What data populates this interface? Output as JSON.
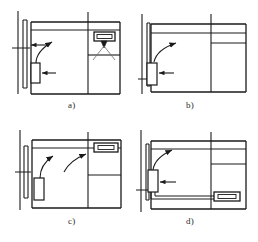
{
  "figure": {
    "title_fragment": "",
    "type": "architectural-floor-plan-set",
    "panel_count": 4,
    "line_color": "#1a1a1a",
    "accent_color": "#3a3a3a",
    "background": "#ffffff"
  },
  "labels": {
    "a": "a)",
    "b": "b)",
    "c": "c)",
    "d": "d)"
  },
  "panels": [
    {
      "id": "a",
      "label": "a)",
      "position": "top-left",
      "description": "Floor plan with double left wall, horizontal top corridor band, vertical partition at right, wall-mounted device on lower left wall and ceiling-mounted device at upper right with two leader lines",
      "devices": [
        {
          "name": "wall-mounted-box-left",
          "orientation": "vertical",
          "wall": "left"
        },
        {
          "name": "ceiling-mounted-box-right",
          "orientation": "horizontal",
          "wall": "top-right"
        }
      ],
      "arrows": [
        {
          "name": "curved-leader-left",
          "style": "curved"
        },
        {
          "name": "pointer-arrow-left",
          "style": "straight-horizontal"
        },
        {
          "name": "pointer-arrow-top",
          "style": "straight-horizontal"
        },
        {
          "name": "leader-pair-right",
          "style": "converging-v"
        }
      ]
    },
    {
      "id": "b",
      "label": "b)",
      "position": "top-right",
      "description": "Floor plan with double left wall and device mounted directly on left wall, horizontal top corridor band, vertical partition at right with short horizontal return",
      "devices": [
        {
          "name": "wall-mounted-box-left",
          "orientation": "vertical",
          "wall": "left"
        }
      ],
      "arrows": [
        {
          "name": "curved-leader-left",
          "style": "curved"
        },
        {
          "name": "pointer-arrow-left",
          "style": "straight-horizontal"
        }
      ]
    },
    {
      "id": "c",
      "label": "c)",
      "position": "bottom-left",
      "description": "Floor plan with double left wall, horizontal top corridor band, vertical partition at right, free-standing device at lower left and horizontal device recessed in the upper right corridor",
      "devices": [
        {
          "name": "floor-box-left",
          "orientation": "vertical",
          "wall": "none"
        },
        {
          "name": "corridor-box-right",
          "orientation": "horizontal",
          "wall": "top-right"
        }
      ],
      "arrows": [
        {
          "name": "curved-leader-left",
          "style": "curved"
        },
        {
          "name": "curved-leader-right",
          "style": "curved"
        }
      ]
    },
    {
      "id": "d",
      "label": "d)",
      "position": "bottom-right",
      "description": "Floor plan with double left wall, device on left wall connected by a routed conduit running down and along the bottom to a horizontal device at the lower right",
      "devices": [
        {
          "name": "wall-mounted-box-left",
          "orientation": "vertical",
          "wall": "left"
        },
        {
          "name": "conduit-box-bottom-right",
          "orientation": "horizontal",
          "wall": "bottom-right"
        }
      ],
      "arrows": [
        {
          "name": "curved-leader-left",
          "style": "curved"
        },
        {
          "name": "pointer-arrow-left",
          "style": "straight-horizontal"
        }
      ],
      "routing": {
        "name": "conduit-run",
        "path": "down-then-right"
      }
    }
  ],
  "caption": {
    "text": ""
  }
}
